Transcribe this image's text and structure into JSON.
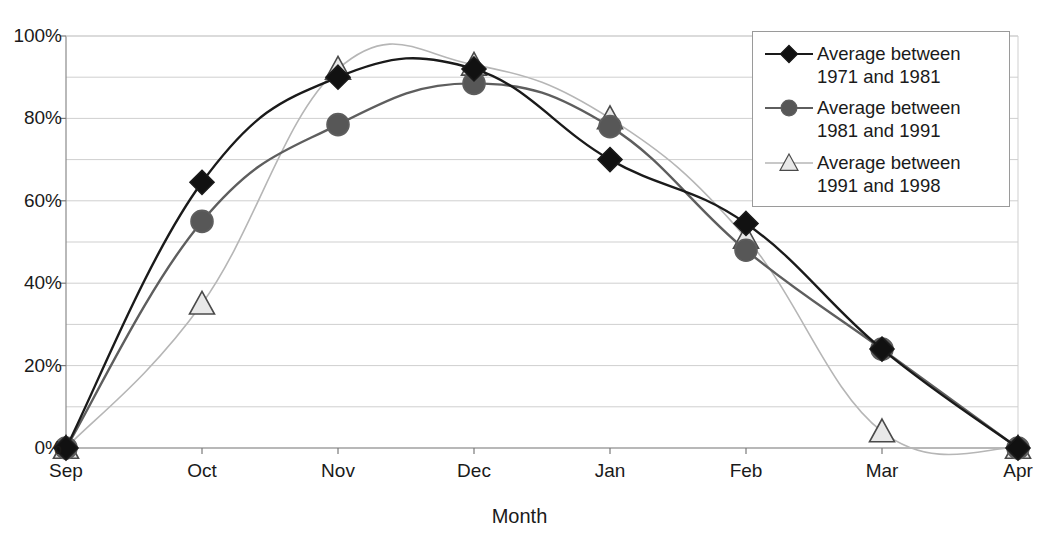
{
  "chart_data": {
    "type": "line",
    "title": "",
    "xlabel": "Month",
    "ylabel": "",
    "categories": [
      "Sep",
      "Oct",
      "Nov",
      "Dec",
      "Jan",
      "Feb",
      "Mar",
      "Apr"
    ],
    "ylim": [
      0,
      100
    ],
    "ytick_labels": [
      "0%",
      "20%",
      "40%",
      "60%",
      "80%",
      "100%"
    ],
    "ytick_values": [
      0,
      20,
      40,
      60,
      80,
      100
    ],
    "grid": true,
    "grid_step": 10,
    "legend_position": "top-right",
    "smoothing": "spline",
    "series": [
      {
        "name": "Average between 1971 and 1981",
        "marker": "diamond",
        "color": "#1a1a1a",
        "marker_fill": "#111111",
        "values": [
          0,
          64.5,
          90,
          92,
          70,
          54.5,
          24,
          0
        ]
      },
      {
        "name": "Average between 1981 and 1991",
        "marker": "circle",
        "color": "#5e5e5e",
        "marker_fill": "#575757",
        "values": [
          0,
          55,
          78.5,
          88.5,
          78,
          48,
          24,
          0
        ]
      },
      {
        "name": "Average between 1991 and 1998",
        "marker": "triangle",
        "color": "#b6b6b6",
        "marker_fill": "#e8e8e8",
        "values": [
          0,
          35,
          92,
          93,
          80,
          51,
          4,
          0
        ]
      }
    ]
  },
  "legend": {
    "entries": [
      {
        "label": "Average between\n1971 and 1981",
        "marker": "diamond"
      },
      {
        "label": "Average between\n1981 and 1991",
        "marker": "circle"
      },
      {
        "label": "Average between\n1991 and 1998",
        "marker": "triangle"
      }
    ]
  },
  "axis_titles": {
    "x": "Month"
  }
}
